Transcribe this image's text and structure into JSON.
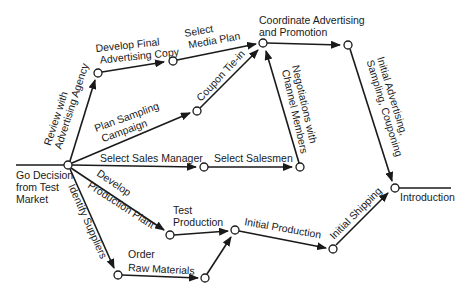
{
  "diagram": {
    "type": "activity-network",
    "colors": {
      "line": "#1a1a1a",
      "node_fill": "#ffffff",
      "background": "#ffffff"
    },
    "start": {
      "label_lines": [
        "Go Decision",
        "from Test",
        "Market"
      ]
    },
    "end": {
      "label": "Introduction"
    },
    "activities": {
      "review_agency": [
        "Review with",
        "Advertising Agency"
      ],
      "develop_copy": [
        "Develop Final",
        "Advertising Copy"
      ],
      "select_media": [
        "Select",
        "Media Plan"
      ],
      "coordinate": [
        "Coordinate Advertising",
        "and Promotion"
      ],
      "plan_sampling": [
        "Plan Sampling",
        "Campaign"
      ],
      "coupon": "Coupon Tie-in",
      "negotiations": [
        "Negotiations with",
        "Channel Members"
      ],
      "initial_adv": [
        "Initial Advertising,",
        "Sampling, Couponing"
      ],
      "sales_manager": "Select Sales Manager",
      "salesmen": "Select Salesmen",
      "develop_plant": [
        "Develop",
        "Production Plant"
      ],
      "test_production": [
        "Test",
        "Production"
      ],
      "identify_suppliers": "Identify Suppliers",
      "order_raw": [
        "Order",
        "Raw Materials"
      ],
      "initial_production": "Initial Production",
      "initial_shipping": "Initial Shipping"
    }
  }
}
